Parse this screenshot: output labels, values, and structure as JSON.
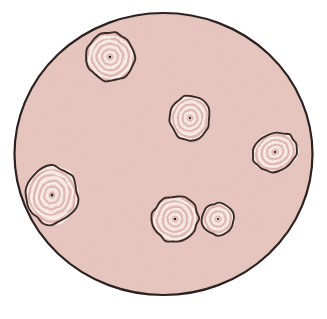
{
  "image": {
    "title": "Petri dish culture with concentric ringed colonies",
    "width": 327,
    "height": 319,
    "background_color": "#ffffff"
  },
  "dish": {
    "label": "petri-dish",
    "center_x": 163.5,
    "center_y": 154,
    "radius_x": 149,
    "radius_y": 141,
    "agar_color": "#e7c5be",
    "rim_color": "#2b2220",
    "rim_width": 2.2
  },
  "palette": {
    "agar": "#e7c5be",
    "colony_base": "#f3e2dc",
    "colony_light_ring": "#f7ece8",
    "colony_rose_ring": "#ddb2aa",
    "colony_mid_ring": "#e9cdc6",
    "colony_outline": "#3a2a26",
    "colony_center_dot": "#2c2120",
    "white": "#ffffff"
  },
  "colonies": [
    {
      "id": "colony-top-left",
      "name": "Colony 1",
      "cx": 110,
      "cy": 57,
      "rx": 24,
      "ry": 24,
      "rotation": -12,
      "rings": 9,
      "center_dot": true,
      "wobble": 1.9
    },
    {
      "id": "colony-center",
      "name": "Colony 2",
      "cx": 190,
      "cy": 118,
      "rx": 20,
      "ry": 22,
      "rotation": 8,
      "rings": 8,
      "center_dot": true,
      "wobble": 1.6
    },
    {
      "id": "colony-right",
      "name": "Colony 3",
      "cx": 275,
      "cy": 152,
      "rx": 23,
      "ry": 19,
      "rotation": -22,
      "rings": 8,
      "center_dot": true,
      "wobble": 1.6
    },
    {
      "id": "colony-left-large",
      "name": "Colony 4",
      "cx": 52,
      "cy": 195,
      "rx": 26,
      "ry": 29,
      "rotation": 10,
      "rings": 10,
      "center_dot": true,
      "wobble": 2.1
    },
    {
      "id": "colony-bottom-center",
      "name": "Colony 5",
      "cx": 175,
      "cy": 219,
      "rx": 23,
      "ry": 23,
      "rotation": 15,
      "rings": 9,
      "center_dot": true,
      "wobble": 1.9
    },
    {
      "id": "colony-bottom-small",
      "name": "Colony 6",
      "cx": 218,
      "cy": 219,
      "rx": 16,
      "ry": 16,
      "rotation": -5,
      "rings": 6,
      "center_dot": true,
      "wobble": 1.4
    }
  ],
  "counts": {
    "colony_count": 6
  }
}
